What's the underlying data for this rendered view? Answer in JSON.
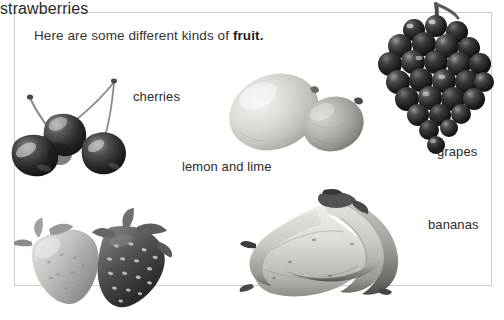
{
  "page": {
    "background_color": "#ffffff",
    "frame_border_color": "#cfcfcf",
    "text_color": "#2b2b2b",
    "width": 504,
    "height": 320
  },
  "title": {
    "lead_text": "Here are some different kinds of ",
    "bold_text": "fruit.",
    "full_text": "Here are some different kinds of fruit."
  },
  "labels": {
    "cherries": "cherries",
    "lemon_and_lime": "lemon and lime",
    "grapes": "grapes",
    "strawberries": "strawberries",
    "bananas": "bananas"
  },
  "images": [
    {
      "name": "cherries-photo",
      "caption": "cherries",
      "description": "three dark cherries with long thin stems"
    },
    {
      "name": "citrus-photo",
      "caption": "lemon and lime",
      "description": "a pale oval lemon and a smaller darker lime"
    },
    {
      "name": "grapes-photo",
      "caption": "grapes",
      "description": "a dense cluster of dark grapes on a stem"
    },
    {
      "name": "strawberries-photo",
      "caption": "strawberries",
      "description": "two strawberries, one pale and one dark and seeded"
    },
    {
      "name": "bananas-photo",
      "caption": "bananas",
      "description": "a bunch of four bananas joined at the crown"
    }
  ]
}
